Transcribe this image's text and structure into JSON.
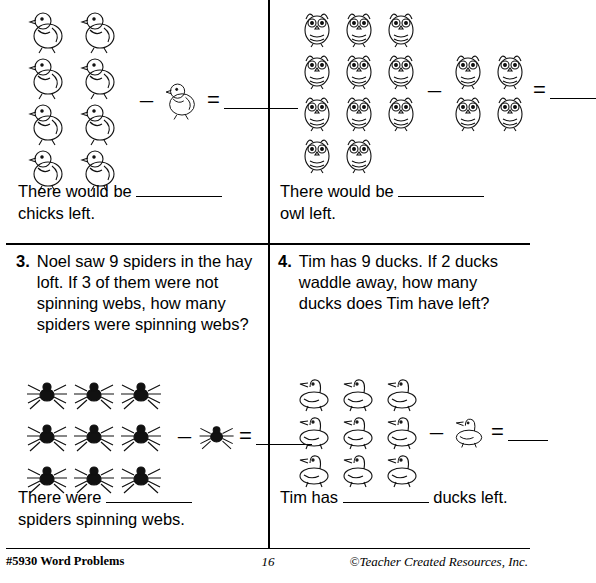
{
  "page": {
    "number": "16",
    "footer_left": "#5930 Word Problems",
    "footer_right": "©Teacher Created Resources, Inc."
  },
  "problems": [
    {
      "number": "1.",
      "question": "",
      "icon": "chick-icon",
      "minuend_count": 8,
      "subtrahend_count": 1,
      "minus": "–",
      "equals": "=",
      "answer_prefix": "There would be",
      "answer_suffix": "chicks left."
    },
    {
      "number": "2.",
      "question": "",
      "icon": "owl-icon",
      "minuend_count": 11,
      "subtrahend_count": 4,
      "minus": "–",
      "equals": "=",
      "answer_prefix": "There would be",
      "answer_suffix": "owl left."
    },
    {
      "number": "3.",
      "question": "Noel saw 9 spiders in the hay loft.  If 3 of them were not spinning webs, how many spiders were spinning webs?",
      "icon": "spider-icon",
      "minuend_count": 9,
      "subtrahend_count": 1,
      "minus": "–",
      "equals": "=",
      "answer_prefix": "There were",
      "answer_suffix": "spiders spinning webs."
    },
    {
      "number": "4.",
      "question": "Tim has 9 ducks.  If 2 ducks waddle away, how many ducks does Tim have left?",
      "icon": "duck-icon",
      "minuend_count": 9,
      "subtrahend_count": 1,
      "minus": "–",
      "equals": "=",
      "answer_prefix": "Tim has",
      "answer_suffix": "ducks left."
    }
  ]
}
